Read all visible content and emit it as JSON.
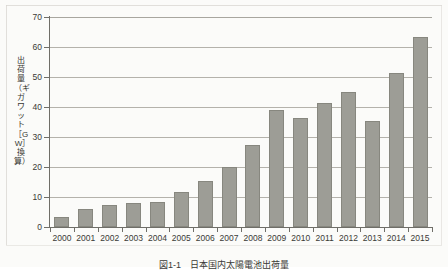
{
  "figure": {
    "caption": "図1-1　日本国内太陽電池出荷量",
    "y_axis_title": "出荷量（ギガワット［GW］換算）"
  },
  "chart_data": {
    "type": "bar",
    "title": "",
    "xlabel": "",
    "ylabel": "出荷量（ギガワット［GW］換算）",
    "ylim": [
      0,
      70
    ],
    "yticks": [
      0,
      10,
      20,
      30,
      40,
      50,
      60,
      70
    ],
    "ytick_labels": [
      "0",
      "10",
      "20",
      "30",
      "40",
      "50",
      "60",
      "70"
    ],
    "grid": true,
    "legend": null,
    "bar_color": "#9d9d96",
    "bar_edge_color": "#87877f",
    "background_color": "#fbfbf9",
    "axis_color": "#6f6e68",
    "gridline_color": "#b4b2ab",
    "categories": [
      "2000",
      "2001",
      "2002",
      "2003",
      "2004",
      "2005",
      "2006",
      "2007",
      "2008",
      "2009",
      "2010",
      "2011",
      "2012",
      "2013",
      "2014",
      "2015"
    ],
    "values": [
      3.5,
      6.0,
      7.2,
      8.0,
      8.2,
      11.7,
      15.3,
      20.1,
      27.3,
      38.9,
      36.2,
      41.5,
      45.0,
      35.5,
      51.5,
      63.2
    ]
  }
}
